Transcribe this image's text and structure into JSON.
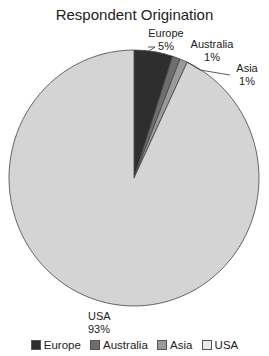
{
  "chart_data": {
    "type": "pie",
    "title": "Respondent Origination",
    "categories": [
      "Europe",
      "Australia",
      "Asia",
      "USA"
    ],
    "values": [
      5,
      1,
      1,
      93
    ],
    "labels": [
      "5%",
      "1%",
      "1%",
      "93%"
    ],
    "colors": [
      "#2e2e2e",
      "#6e6e6e",
      "#9a9a9a",
      "#d4d4d4"
    ],
    "legend_position": "bottom"
  },
  "legend": [
    {
      "label": "Europe",
      "color": "#2e2e2e"
    },
    {
      "label": "Australia",
      "color": "#6e6e6e"
    },
    {
      "label": "Asia",
      "color": "#9a9a9a"
    },
    {
      "label": "USA",
      "color": "#e8e8e8"
    }
  ]
}
